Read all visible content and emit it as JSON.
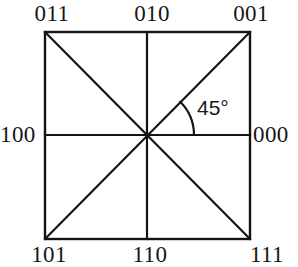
{
  "figure": {
    "background_color": "#ffffff",
    "line_color": "#141414",
    "line_width_px": 2,
    "square": {
      "left": 44,
      "top": 31,
      "right": 251,
      "bottom": 240,
      "center_x": 147,
      "center_y": 135
    },
    "angle": {
      "value_label": "45°",
      "degrees": 45,
      "arc_radius_px": 47,
      "arc_start_deg": 45,
      "arc_end_deg": 0,
      "between": [
        "east-ray",
        "northeast-diagonal"
      ]
    },
    "labels": [
      {
        "id": "011",
        "code": "011",
        "text": "011",
        "position": "top-left",
        "direction": "northwest",
        "angle_deg": 135
      },
      {
        "id": "010",
        "code": "010",
        "text": "010",
        "position": "top-center",
        "direction": "north",
        "angle_deg": 90
      },
      {
        "id": "001",
        "code": "001",
        "text": "001",
        "position": "top-right",
        "direction": "northeast",
        "angle_deg": 45
      },
      {
        "id": "100",
        "code": "100",
        "text": "100",
        "position": "middle-left",
        "direction": "west",
        "angle_deg": 180
      },
      {
        "id": "000",
        "code": "000",
        "text": "000",
        "position": "middle-right",
        "direction": "east",
        "angle_deg": 0
      },
      {
        "id": "101",
        "code": "101",
        "text": "101",
        "position": "bottom-left",
        "direction": "southwest",
        "angle_deg": 225
      },
      {
        "id": "110",
        "code": "110",
        "text": "110",
        "position": "bottom-center",
        "direction": "south",
        "angle_deg": 270
      },
      {
        "id": "111",
        "code": "111",
        "text": "111",
        "position": "bottom-right",
        "direction": "southeast",
        "angle_deg": 315
      }
    ]
  }
}
